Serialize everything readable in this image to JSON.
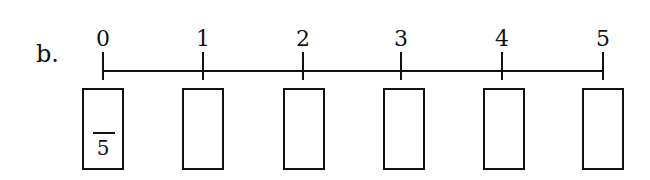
{
  "problem": {
    "label": "b."
  },
  "number_line": {
    "ticks": [
      "0",
      "1",
      "2",
      "3",
      "4",
      "5"
    ],
    "positions": [
      103,
      203,
      303,
      401,
      502,
      603
    ]
  },
  "boxes": [
    {
      "denominator": "5"
    },
    {
      "denominator": ""
    },
    {
      "denominator": ""
    },
    {
      "denominator": ""
    },
    {
      "denominator": ""
    },
    {
      "denominator": ""
    }
  ]
}
